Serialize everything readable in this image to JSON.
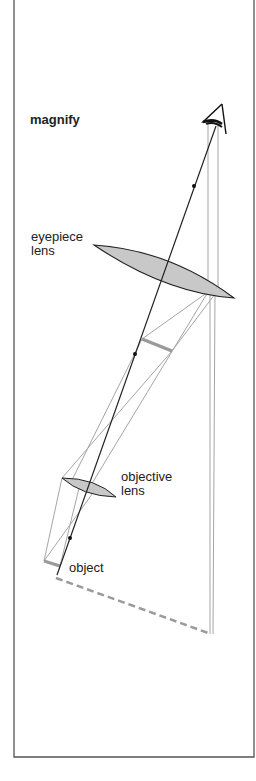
{
  "title": "magnify",
  "labels": {
    "eyepiece": [
      "eyepiece",
      "lens"
    ],
    "objective": [
      "objective",
      "lens"
    ],
    "object": "object"
  },
  "colors": {
    "border": "#555555",
    "ray_dark": "#222222",
    "ray_light": "#a0a0a0",
    "lens_fill": "#c8c8c8",
    "image_bar": "#9a9a9a",
    "virtual_image": "#9a9a9a"
  }
}
